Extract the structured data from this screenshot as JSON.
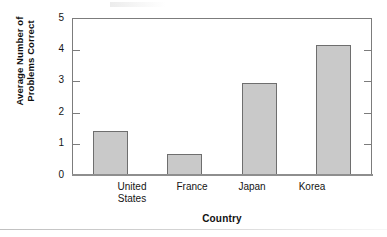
{
  "figure": {
    "background_color": "#ffffff",
    "frame_color": "#7c7c7c",
    "bar_fill_color": "#c9c9c9",
    "bar_border_color": "#6e6e6e"
  },
  "axes": {
    "y_title_line1": "Average Number of",
    "y_title_line2": "Problems Correct",
    "x_title": "Country",
    "y_tick_labels": [
      "5",
      "4",
      "3",
      "2",
      "1",
      "0"
    ]
  },
  "chart_data": {
    "type": "bar",
    "title": "",
    "subtitle": "",
    "xlabel": "Country",
    "ylabel": "Average Number of Problems Correct",
    "categories": [
      "United States",
      "France",
      "Japan",
      "Korea"
    ],
    "category_label_lines": [
      [
        "United",
        "States"
      ],
      [
        "France"
      ],
      [
        "Japan"
      ],
      [
        "Korea"
      ]
    ],
    "values": [
      1.4,
      0.65,
      2.93,
      4.17
    ],
    "series": [
      {
        "name": "Average Number of Problems Correct",
        "values": [
          1.4,
          0.65,
          2.93,
          4.17
        ]
      }
    ],
    "ylim": [
      0,
      5
    ],
    "ytick_values": [
      0,
      1,
      2,
      3,
      4,
      5
    ],
    "grid": false,
    "legend": false,
    "legend_position": "none",
    "bar_fill_color": "#c9c9c9",
    "bar_border_color": "#6e6e6e",
    "annotations": []
  }
}
